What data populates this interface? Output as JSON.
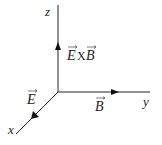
{
  "diagram": {
    "type": "3d-coordinate-axes",
    "axes": {
      "x": {
        "label": "x",
        "direction": "down-left (toward viewer)"
      },
      "y": {
        "label": "y",
        "direction": "right"
      },
      "z": {
        "label": "z",
        "direction": "up"
      }
    },
    "vectors": [
      {
        "id": "E",
        "label": "E",
        "has_arrow_over": true,
        "along_axis": "x"
      },
      {
        "id": "B",
        "label": "B",
        "has_arrow_over": true,
        "along_axis": "y"
      },
      {
        "id": "ExB",
        "label": "EXB",
        "parts": [
          "E",
          "X",
          "B"
        ],
        "has_arrow_over": true,
        "along_axis": "z"
      }
    ],
    "colors": {
      "line": "#222222",
      "background": "#ffffff"
    }
  }
}
